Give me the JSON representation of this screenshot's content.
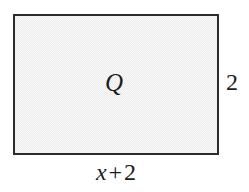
{
  "figure": {
    "type": "geometry-diagram",
    "background_color": "#ffffff"
  },
  "shape": {
    "kind": "rectangle",
    "interior_label": "Q",
    "fill_color": "#e9e9e9",
    "fill_style": "dithered-gray",
    "border_color": "#2b2b2b",
    "border_width_px": 2,
    "x_px": 13,
    "y_px": 14,
    "width_px": 206,
    "height_px": 141
  },
  "labels": {
    "height": {
      "text": "2",
      "position": "right"
    },
    "width": {
      "variable": "x",
      "operator": "+",
      "constant": "2",
      "text": "x + 2",
      "position": "bottom"
    }
  }
}
